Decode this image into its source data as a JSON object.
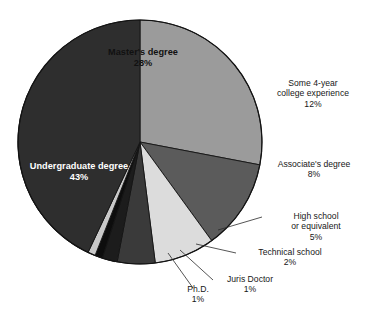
{
  "chart_data": {
    "type": "pie",
    "title": "",
    "categories": [
      "Undergraduate degree",
      "Master's degree",
      "Some 4-year college experience",
      "Associate's degree",
      "High school or equivalent",
      "Technical school",
      "Juris Doctor",
      "Ph.D."
    ],
    "values": [
      43,
      28,
      12,
      8,
      5,
      2,
      1,
      1
    ],
    "unit": "%",
    "legend": "none",
    "grid": false,
    "slice_colors": [
      "#2e2e2e",
      "#9b9b9b",
      "#5b5b5b",
      "#dcdcdc",
      "#3a3a3a",
      "#1c1c1c",
      "#0d0d0d",
      "#c9c9c9"
    ]
  },
  "slices": {
    "undergraduate": {
      "label": "Undergraduate degree",
      "percent": "43%",
      "color": "#2e2e2e"
    },
    "masters": {
      "label": "Master's degree",
      "percent": "28%",
      "color": "#9b9b9b"
    },
    "some_college": {
      "label_line1": "Some 4-year",
      "label_line2": "college experience",
      "percent": "12%",
      "color": "#5b5b5b"
    },
    "associates": {
      "label": "Associate's degree",
      "percent": "8%",
      "color": "#dcdcdc"
    },
    "high_school": {
      "label_line1": "High school",
      "label_line2": "or equivalent",
      "percent": "5%",
      "color": "#3a3a3a"
    },
    "technical": {
      "label": "Technical school",
      "percent": "2%",
      "color": "#1c1c1c"
    },
    "juris_doctor": {
      "label": "Juris Doctor",
      "percent": "1%",
      "color": "#0d0d0d"
    },
    "phd": {
      "label": "Ph.D.",
      "percent": "1%",
      "color": "#c9c9c9"
    }
  }
}
